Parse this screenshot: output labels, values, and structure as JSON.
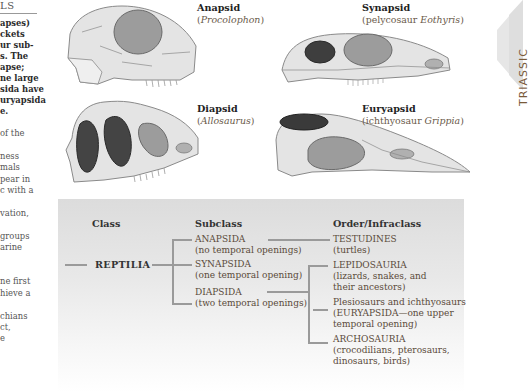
{
  "left_column": {
    "heading_fragment": "LS",
    "bold_lines": [
      "apses)",
      "ckets",
      "ur sub-",
      "s. The",
      " apse;",
      "ne large",
      "sida have",
      "uryapsida",
      "e."
    ],
    "body_lines": [
      "of the",
      "",
      "ness",
      "mals",
      "pear in",
      "c with a",
      "",
      "vation,",
      "",
      "groups",
      "arine",
      "",
      "",
      "ne first",
      "hieve a",
      "",
      "chians",
      "ct,",
      "e"
    ]
  },
  "skulls": [
    {
      "type": "Anapsid",
      "example_prefix": "(",
      "example_genus": "Procolophon",
      "example_suffix": ")"
    },
    {
      "type": "Synapsid",
      "example_prefix": "(pelycosaur ",
      "example_genus": "Eothyris",
      "example_suffix": ")"
    },
    {
      "type": "Diapsid",
      "example_prefix": "(",
      "example_genus": "Allosaurus",
      "example_suffix": ")"
    },
    {
      "type": "Euryapsid",
      "example_prefix": "(ichthyosaur ",
      "example_genus": "Grippia",
      "example_suffix": ")"
    }
  ],
  "period_tab": {
    "label": "TRIASSIC",
    "color": "#e9e9e9"
  },
  "classification": {
    "headers": {
      "class": "Class",
      "subclass": "Subclass",
      "order": "Order/Infraclass"
    },
    "class_name": "REPTILIA",
    "subclasses": [
      {
        "name": "ANAPSIDA",
        "desc": "(no temporal openings)"
      },
      {
        "name": "SYNAPSIDA",
        "desc": "(one temporal opening)"
      },
      {
        "name": "DIAPSIDA",
        "desc": "(two temporal openings)"
      }
    ],
    "orders": [
      {
        "lines": [
          "TESTUDINES",
          "(turtles)"
        ]
      },
      {
        "lines": [
          "LEPIDOSAURIA",
          "(lizards, snakes, and",
          "their ancestors)"
        ]
      },
      {
        "lines": [
          "Plesiosaurs and ichthyosaurs",
          "(EURYAPSIDA—one upper",
          "temporal opening)"
        ]
      },
      {
        "lines": [
          "ARCHOSAURIA",
          "(crocodilians, pterosaurs,",
          "dinosaurs, birds)"
        ]
      }
    ]
  },
  "colors": {
    "bone": "#e4e4e4",
    "bone_outline": "#8a8a8a",
    "opening_light": "#9a9a9a",
    "opening_dark": "#4a4a4a",
    "connector": "#9a9a9a"
  }
}
